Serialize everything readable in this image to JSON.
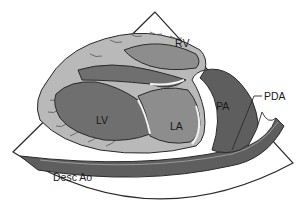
{
  "diagram": {
    "title": "",
    "view": "echocardiographic sector view",
    "labels": {
      "rv": "RV",
      "lv": "LV",
      "la": "LA",
      "pa": "PA",
      "pda": "PDA",
      "desc_ao": "Desc Ao"
    },
    "colors": {
      "background": "#ffffff",
      "outline": "#2a2a2a",
      "myocardium": "#b9b9b9",
      "chamber_mid": "#8d8d8d",
      "chamber_dark": "#6f6f6f",
      "vessel_dark": "#5e5e5e",
      "valve_highlight": "#f2f2f2"
    }
  }
}
